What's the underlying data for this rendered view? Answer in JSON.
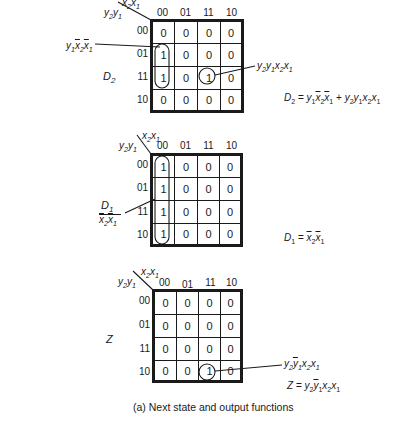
{
  "diagram": {
    "caption": "(a)  Next state and output functions",
    "column_variables": "x2x1",
    "row_variables": "y2y1",
    "column_labels": [
      "00",
      "01",
      "11",
      "10"
    ],
    "row_labels": [
      "00",
      "01",
      "11",
      "10"
    ],
    "maps": [
      {
        "name": "D2",
        "cells": [
          [
            "0",
            "0",
            "0",
            "0"
          ],
          [
            "1",
            "0",
            "0",
            "0"
          ],
          [
            "1",
            "0",
            "1",
            "0"
          ],
          [
            "0",
            "0",
            "0",
            "0"
          ]
        ],
        "term_labels": [
          "y1x̄2x̄1",
          "y2y1x2x1"
        ],
        "equation": "D2 = y1x̄2x̄1 + y2y1x2x1"
      },
      {
        "name": "D1",
        "cells": [
          [
            "1",
            "0",
            "0",
            "0"
          ],
          [
            "1",
            "0",
            "0",
            "0"
          ],
          [
            "1",
            "0",
            "0",
            "0"
          ],
          [
            "1",
            "0",
            "0",
            "0"
          ]
        ],
        "term_labels": [
          "x̄2x̄1"
        ],
        "equation": "D1 = x̄2x̄1"
      },
      {
        "name": "Z",
        "cells": [
          [
            "0",
            "0",
            "0",
            "0"
          ],
          [
            "0",
            "0",
            "0",
            "0"
          ],
          [
            "0",
            "0",
            "0",
            "0"
          ],
          [
            "0",
            "0",
            "1",
            "0"
          ]
        ],
        "term_labels": [
          "y2ȳ1x2x1"
        ],
        "equation": "Z = y2ȳ1x2x1"
      }
    ]
  }
}
